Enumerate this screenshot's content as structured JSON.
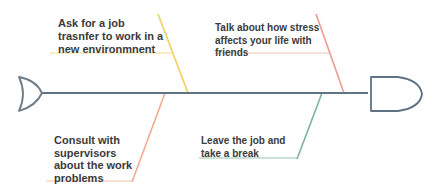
{
  "diagram": {
    "type": "fishbone",
    "colors": {
      "spine": "#5f7384",
      "head_outline": "#5f7384",
      "tail_outline": "#6b7b88",
      "text": "#3a3a3a",
      "bone_top_left": "#f0d36a",
      "bone_top_right": "#ee9a8e",
      "bone_bottom_left": "#f2a68e",
      "bone_bottom_right": "#7fb0aa"
    },
    "bones": [
      {
        "id": "top-left",
        "lines": [
          "Ask for a job",
          "trasnfer to work in a",
          "new environmnent"
        ]
      },
      {
        "id": "top-right",
        "lines": [
          "Talk about how stress",
          "affects your life with",
          "friends"
        ]
      },
      {
        "id": "bottom-left",
        "lines": [
          "Consult with",
          "supervisors",
          "about the work",
          "problems"
        ]
      },
      {
        "id": "bottom-right",
        "lines": [
          "Leave the job and",
          "take a break"
        ]
      }
    ]
  }
}
